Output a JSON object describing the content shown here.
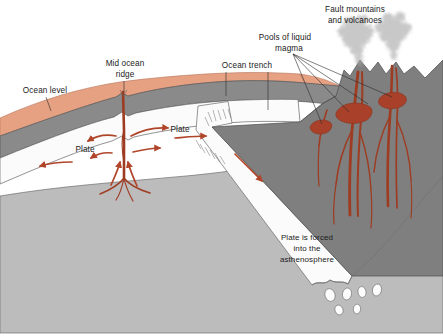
{
  "diagram": {
    "labels": {
      "ocean_level": "Ocean level",
      "mid_ocean_ridge_line1": "Mid ocean",
      "mid_ocean_ridge_line2": "ridge",
      "ocean_trench": "Ocean trench",
      "pools_line1": "Pools of liquid",
      "pools_line2": "magma",
      "fault_line1": "Fault mountains",
      "fault_line2": "and volcanoes",
      "plate_left": "Plate",
      "plate_right": "Plate",
      "subduction_line1": "Plate is forced",
      "subduction_line2": "into the",
      "subduction_line3": "asthenosphere"
    },
    "colors": {
      "background": "#ffffff",
      "ocean_water": "#e6a183",
      "oceanic_crust": "#8a8a8a",
      "lithosphere_slab": "#fbfbfb",
      "asthenosphere": "#bcbcbc",
      "continent": "#7f7f7f",
      "magma": "#9e3c22",
      "magma_pool": "#a8402a",
      "arrow": "#b1452a",
      "ash_plume": "#b9b9b9",
      "text": "#1b1b1b",
      "outline": "#4a4a4a"
    }
  }
}
